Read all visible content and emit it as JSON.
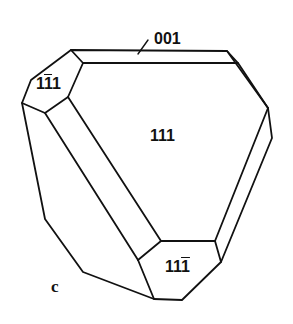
{
  "figure": {
    "panel_label": "c",
    "faces": [
      {
        "id": "face-001",
        "label": "001",
        "barred_digit": null
      },
      {
        "id": "face-1-11",
        "label_parts": [
          "1",
          "1",
          "1"
        ],
        "barred_index": 1,
        "label": "1̄1\u00001"
      },
      {
        "id": "face-111",
        "label": "111",
        "barred_digit": null
      },
      {
        "id": "face-11-1",
        "label_parts": [
          "1",
          "1",
          "1"
        ],
        "barred_index": 2
      }
    ],
    "labels": {
      "face_001": "001",
      "face_111": "111",
      "face_1m11_a": "1",
      "face_1m11_b": "1",
      "face_1m11_c": "1",
      "face_11m1_a": "1",
      "face_11m1_b": "1",
      "face_11m1_c": "1"
    },
    "colors": {
      "line": "#111111",
      "background": "#ffffff"
    }
  }
}
